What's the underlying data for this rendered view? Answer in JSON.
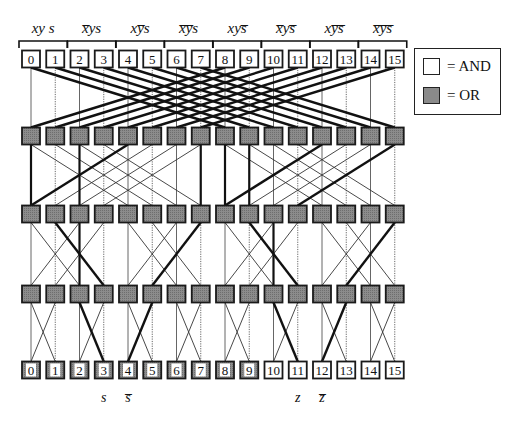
{
  "figure": {
    "title": "",
    "group_labels": [
      {
        "text": "xys",
        "overline": "",
        "html": "xy s"
      },
      {
        "text": "x̅ys",
        "overline": "x",
        "html": "x̅ys"
      },
      {
        "text": "xy̅s",
        "overline": "y",
        "html": "xy̅s"
      },
      {
        "text": "x̅y̅s",
        "overline": "xy",
        "html": "x̅y̅s"
      },
      {
        "text": "xys̅",
        "overline": "s",
        "html": "xys̅"
      },
      {
        "text": "x̅ys̅",
        "overline": "xs",
        "html": "x̅ys̅"
      },
      {
        "text": "xy̅s̅",
        "overline": "ys",
        "html": "xy̅s̅"
      },
      {
        "text": "x̅y̅s̅",
        "overline": "xys",
        "html": "x̅y̅s̅"
      }
    ],
    "input_nodes": [
      "0",
      "1",
      "2",
      "3",
      "4",
      "5",
      "6",
      "7",
      "8",
      "9",
      "10",
      "11",
      "12",
      "13",
      "14",
      "15"
    ],
    "output_nodes": [
      "0",
      "1",
      "2",
      "3",
      "4",
      "5",
      "6",
      "7",
      "8",
      "9",
      "10",
      "11",
      "12",
      "13",
      "14",
      "15"
    ],
    "or_rows": 3,
    "or_nodes_per_row": 16,
    "bottom_labels": [
      {
        "text": "s",
        "under_column": 3
      },
      {
        "text": "s̅",
        "under_column": 4
      },
      {
        "text": "z",
        "under_column": 11
      },
      {
        "text": "z̅",
        "under_column": 12
      }
    ],
    "stage_strides": [
      8,
      4,
      2,
      1
    ],
    "highlighted_paths": [
      {
        "from_stage": 0,
        "edges": [
          [
            0,
            8
          ],
          [
            1,
            9
          ],
          [
            2,
            10
          ],
          [
            3,
            11
          ],
          [
            4,
            12
          ],
          [
            5,
            13
          ],
          [
            6,
            14
          ],
          [
            7,
            15
          ],
          [
            8,
            0
          ],
          [
            9,
            1
          ],
          [
            10,
            2
          ],
          [
            11,
            3
          ],
          [
            12,
            4
          ],
          [
            13,
            5
          ],
          [
            14,
            6
          ],
          [
            15,
            7
          ]
        ]
      },
      {
        "from_stage": 1,
        "edges": [
          [
            0,
            0
          ],
          [
            2,
            2
          ],
          [
            4,
            0
          ],
          [
            6,
            10
          ],
          [
            7,
            7
          ],
          [
            8,
            8
          ],
          [
            9,
            9
          ],
          [
            12,
            8
          ],
          [
            13,
            15
          ],
          [
            15,
            11
          ]
        ]
      },
      {
        "from_stage": 2,
        "edges": [
          [
            1,
            3
          ],
          [
            2,
            2
          ],
          [
            7,
            5
          ],
          [
            9,
            11
          ],
          [
            10,
            10
          ],
          [
            15,
            13
          ]
        ]
      },
      {
        "from_stage": 3,
        "edges": [
          [
            2,
            3
          ],
          [
            5,
            4
          ],
          [
            10,
            11
          ],
          [
            13,
            12
          ]
        ]
      }
    ]
  },
  "legend": {
    "items": [
      {
        "symbol": "white-box",
        "label": "= AND",
        "color": "#ffffff"
      },
      {
        "symbol": "gray-box",
        "label": "= OR",
        "color": "#8a8a8a"
      }
    ]
  },
  "colors": {
    "line": "#111111",
    "or_fill": "#8a8a8a",
    "and_fill": "#ffffff",
    "background": "#ffffff"
  }
}
